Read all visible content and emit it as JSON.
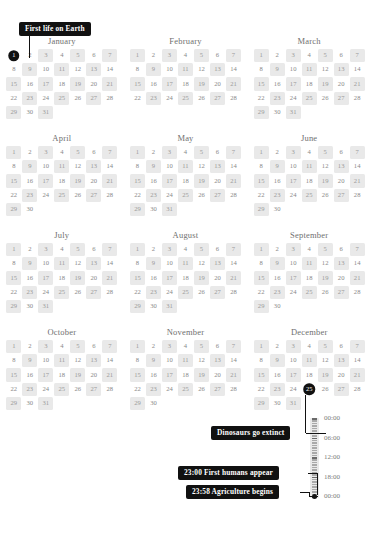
{
  "months": [
    {
      "name": "January",
      "days": 31,
      "lead_blank": 0,
      "shaded": [
        3,
        5,
        7,
        9,
        11,
        13,
        15,
        17,
        19,
        21,
        23,
        25,
        27,
        29,
        31
      ],
      "marked": [
        1
      ]
    },
    {
      "name": "February",
      "days": 28,
      "lead_blank": 0,
      "shaded": [
        1,
        3,
        5,
        7,
        9,
        11,
        13,
        15,
        17,
        19,
        21,
        23,
        25,
        27
      ],
      "marked": []
    },
    {
      "name": "March",
      "days": 31,
      "lead_blank": 0,
      "shaded": [
        1,
        3,
        5,
        7,
        9,
        11,
        13,
        15,
        17,
        19,
        21,
        23,
        25,
        27,
        29,
        31
      ],
      "marked": []
    },
    {
      "name": "April",
      "days": 30,
      "lead_blank": 0,
      "shaded": [
        1,
        3,
        5,
        7,
        9,
        11,
        13,
        15,
        17,
        19,
        21,
        23,
        25,
        27,
        29
      ],
      "marked": []
    },
    {
      "name": "May",
      "days": 31,
      "lead_blank": 0,
      "shaded": [
        1,
        3,
        5,
        7,
        9,
        11,
        13,
        15,
        17,
        19,
        21,
        23,
        25,
        27,
        29,
        31
      ],
      "marked": []
    },
    {
      "name": "June",
      "days": 30,
      "lead_blank": 0,
      "shaded": [
        1,
        3,
        5,
        7,
        9,
        11,
        13,
        15,
        17,
        19,
        21,
        23,
        25,
        27,
        29
      ],
      "marked": []
    },
    {
      "name": "July",
      "days": 31,
      "lead_blank": 0,
      "shaded": [
        1,
        3,
        5,
        7,
        9,
        11,
        13,
        15,
        17,
        19,
        21,
        23,
        25,
        27,
        29,
        31
      ],
      "marked": []
    },
    {
      "name": "August",
      "days": 31,
      "lead_blank": 0,
      "shaded": [
        1,
        3,
        5,
        7,
        9,
        11,
        13,
        15,
        17,
        19,
        21,
        23,
        25,
        27,
        29,
        31
      ],
      "marked": []
    },
    {
      "name": "September",
      "days": 30,
      "lead_blank": 0,
      "shaded": [
        1,
        3,
        5,
        7,
        9,
        11,
        13,
        15,
        17,
        19,
        21,
        23,
        25,
        27,
        29
      ],
      "marked": []
    },
    {
      "name": "October",
      "days": 31,
      "lead_blank": 0,
      "shaded": [
        1,
        3,
        5,
        7,
        9,
        11,
        13,
        15,
        17,
        19,
        21,
        23,
        25,
        27,
        29,
        31
      ],
      "marked": []
    },
    {
      "name": "November",
      "days": 30,
      "lead_blank": 0,
      "shaded": [
        1,
        3,
        5,
        7,
        9,
        11,
        13,
        15,
        17,
        19,
        21,
        23,
        25,
        27,
        29
      ],
      "marked": []
    },
    {
      "name": "December",
      "days": 31,
      "lead_blank": 0,
      "shaded": [
        1,
        3,
        5,
        7,
        9,
        11,
        13,
        15,
        17,
        19,
        21,
        23,
        27,
        29,
        31
      ],
      "marked": [
        25
      ]
    }
  ],
  "annotations": [
    {
      "id": "first-life",
      "label": "First life on Earth"
    },
    {
      "id": "dinosaurs",
      "label": "Dinosaurs go extinct"
    },
    {
      "id": "humans",
      "label": "23:00 First humans appear"
    },
    {
      "id": "agriculture",
      "label": "23:58 Agriculture begins"
    }
  ],
  "timeline": {
    "labels": [
      "00:00",
      "06:00",
      "12:00",
      "18:00",
      "00:00"
    ]
  },
  "colors": {
    "ink": "#111111",
    "shaded_cell": "#e9e9e9",
    "day_text": "#8a8a8a",
    "month_text": "#6f6f6f",
    "background": "#ffffff"
  }
}
